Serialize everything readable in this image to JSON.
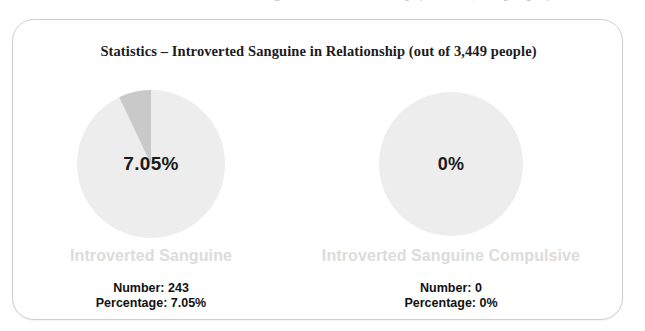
{
  "top_clipped_text": "Statistics – Introverted Sanguine in Relationship (out of 3,449 people)",
  "card": {
    "title": "Statistics – Introverted Sanguine in Relationship (out of 3,449 people)"
  },
  "colors": {
    "pie_base": "#ededed",
    "pie_slice": "#c9c9c9",
    "series_label": "#dcdcdc",
    "title_text": "#1c1c1c",
    "stat_text": "#111111",
    "card_border": "#cfcfd2"
  },
  "panels": [
    {
      "name": "introverted-sanguine",
      "center_value": "7.05%",
      "series_label": "Introverted Sanguine",
      "number_line": "Number: 243",
      "percentage_line": "Percentage: 7.05%"
    },
    {
      "name": "introverted-sanguine-compulsive",
      "center_value": "0%",
      "series_label": "Introverted Sanguine Compulsive",
      "number_line": "Number: 0",
      "percentage_line": "Percentage: 0%"
    }
  ],
  "chart_data": {
    "type": "pie",
    "title": "Statistics – Introverted Sanguine in Relationship (out of 3,449 people)",
    "total_population": 3449,
    "charts": [
      {
        "name": "Introverted Sanguine",
        "labels": [
          "Introverted Sanguine",
          "Remainder"
        ],
        "values": [
          243,
          3206
        ],
        "percentages": [
          7.05,
          92.95
        ],
        "slice_colors": [
          "#c9c9c9",
          "#ededed"
        ],
        "center_label": "7.05%",
        "start_angle_deg": -25.4,
        "sweep_angle_deg": 25.4
      },
      {
        "name": "Introverted Sanguine Compulsive",
        "labels": [
          "Introverted Sanguine Compulsive",
          "Remainder"
        ],
        "values": [
          0,
          3449
        ],
        "percentages": [
          0,
          100
        ],
        "slice_colors": [
          "#c9c9c9",
          "#ededed"
        ],
        "center_label": "0%",
        "start_angle_deg": 0,
        "sweep_angle_deg": 0
      }
    ],
    "legend": "none",
    "grid": false
  }
}
